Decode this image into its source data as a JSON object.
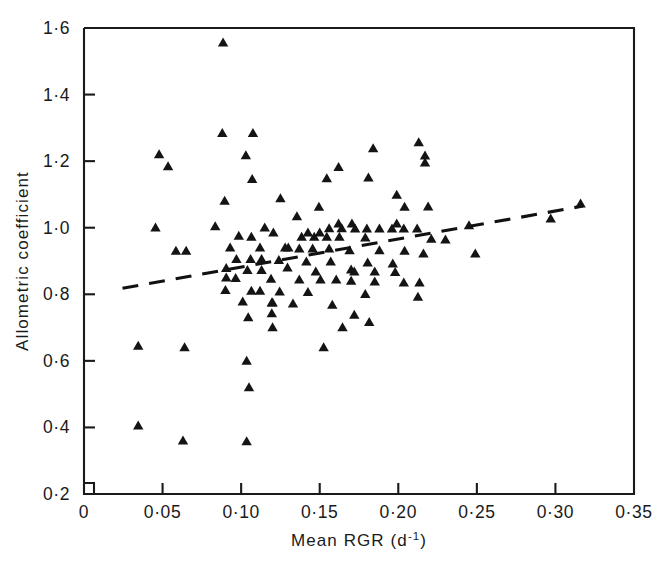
{
  "chart_data": {
    "type": "scatter",
    "title": "",
    "xlabel": "Mean RGR (d-1)",
    "xlabel_main": "Mean RGR (d",
    "xlabel_exponent": "-1",
    "xlabel_close": ")",
    "ylabel": "Allometric coefficient",
    "xlim": [
      0,
      0.35
    ],
    "ylim": [
      0.2,
      1.6
    ],
    "grid": false,
    "legend": null,
    "xticks": [
      0,
      0.05,
      0.1,
      0.15,
      0.2,
      0.25,
      0.3,
      0.35
    ],
    "xticklabels": [
      "0",
      "0·05",
      "0·10",
      "0·15",
      "0·20",
      "0·25",
      "0·30",
      "0·35"
    ],
    "yticks": [
      0.2,
      0.4,
      0.6,
      0.8,
      1.0,
      1.2,
      1.4,
      1.6
    ],
    "yticklabels": [
      "0·2",
      "0·4",
      "0·6",
      "0·8",
      "1·0",
      "1·2",
      "1·4",
      "1·6"
    ],
    "marker": "triangle-up",
    "marker_color": "#141414",
    "series": [
      {
        "name": "observations",
        "points": [
          [
            0.0885,
            1.556
          ],
          [
            0.088,
            1.284
          ],
          [
            0.1075,
            1.284
          ],
          [
            0.0478,
            1.22
          ],
          [
            0.0535,
            1.184
          ],
          [
            0.103,
            1.217
          ],
          [
            0.107,
            1.146
          ],
          [
            0.0455,
            1.0
          ],
          [
            0.184,
            1.238
          ],
          [
            0.213,
            1.256
          ],
          [
            0.217,
            1.195
          ],
          [
            0.217,
            1.216
          ],
          [
            0.162,
            1.182
          ],
          [
            0.1545,
            1.148
          ],
          [
            0.181,
            1.15
          ],
          [
            0.199,
            1.098
          ],
          [
            0.125,
            1.088
          ],
          [
            0.0895,
            1.08
          ],
          [
            0.1495,
            1.062
          ],
          [
            0.204,
            1.062
          ],
          [
            0.219,
            1.063
          ],
          [
            0.316,
            1.072
          ],
          [
            0.297,
            1.027
          ],
          [
            0.1355,
            1.034
          ],
          [
            0.245,
            1.007
          ],
          [
            0.0835,
            1.004
          ],
          [
            0.115,
            1.0
          ],
          [
            0.162,
            1.012
          ],
          [
            0.1705,
            1.012
          ],
          [
            0.199,
            1.012
          ],
          [
            0.156,
            0.998
          ],
          [
            0.164,
            0.998
          ],
          [
            0.1725,
            0.997
          ],
          [
            0.18,
            0.997
          ],
          [
            0.188,
            0.997
          ],
          [
            0.196,
            0.997
          ],
          [
            0.2035,
            0.997
          ],
          [
            0.212,
            0.997
          ],
          [
            0.1205,
            0.985
          ],
          [
            0.1425,
            0.985
          ],
          [
            0.15,
            0.985
          ],
          [
            0.0985,
            0.975
          ],
          [
            0.1065,
            0.972
          ],
          [
            0.1385,
            0.972
          ],
          [
            0.1465,
            0.972
          ],
          [
            0.1545,
            0.972
          ],
          [
            0.1625,
            0.972
          ],
          [
            0.179,
            0.97
          ],
          [
            0.221,
            0.966
          ],
          [
            0.23,
            0.964
          ],
          [
            0.249,
            0.922
          ],
          [
            0.216,
            0.922
          ],
          [
            0.0585,
            0.93
          ],
          [
            0.065,
            0.93
          ],
          [
            0.093,
            0.94
          ],
          [
            0.112,
            0.94
          ],
          [
            0.128,
            0.94
          ],
          [
            0.13,
            0.94
          ],
          [
            0.137,
            0.937
          ],
          [
            0.1455,
            0.937
          ],
          [
            0.156,
            0.937
          ],
          [
            0.169,
            0.932
          ],
          [
            0.188,
            0.932
          ],
          [
            0.204,
            0.93
          ],
          [
            0.097,
            0.905
          ],
          [
            0.106,
            0.905
          ],
          [
            0.113,
            0.905
          ],
          [
            0.124,
            0.902
          ],
          [
            0.1415,
            0.898
          ],
          [
            0.157,
            0.898
          ],
          [
            0.1805,
            0.895
          ],
          [
            0.1965,
            0.892
          ],
          [
            0.1295,
            0.88
          ],
          [
            0.17,
            0.874
          ],
          [
            0.0905,
            0.878
          ],
          [
            0.104,
            0.872
          ],
          [
            0.113,
            0.872
          ],
          [
            0.1475,
            0.868
          ],
          [
            0.172,
            0.868
          ],
          [
            0.185,
            0.868
          ],
          [
            0.198,
            0.866
          ],
          [
            0.0905,
            0.85
          ],
          [
            0.0965,
            0.848
          ],
          [
            0.119,
            0.846
          ],
          [
            0.137,
            0.844
          ],
          [
            0.1505,
            0.844
          ],
          [
            0.1605,
            0.844
          ],
          [
            0.17,
            0.84
          ],
          [
            0.185,
            0.838
          ],
          [
            0.2035,
            0.835
          ],
          [
            0.2135,
            0.835
          ],
          [
            0.09,
            0.812
          ],
          [
            0.1065,
            0.81
          ],
          [
            0.112,
            0.81
          ],
          [
            0.1245,
            0.808
          ],
          [
            0.1425,
            0.806
          ],
          [
            0.179,
            0.8
          ],
          [
            0.2125,
            0.792
          ],
          [
            0.101,
            0.778
          ],
          [
            0.1195,
            0.775
          ],
          [
            0.12,
            0.775
          ],
          [
            0.133,
            0.772
          ],
          [
            0.158,
            0.768
          ],
          [
            0.1195,
            0.742
          ],
          [
            0.172,
            0.738
          ],
          [
            0.1045,
            0.73
          ],
          [
            0.1815,
            0.716
          ],
          [
            0.12,
            0.7
          ],
          [
            0.1645,
            0.7
          ],
          [
            0.0345,
            0.645
          ],
          [
            0.064,
            0.64
          ],
          [
            0.1525,
            0.64
          ],
          [
            0.1035,
            0.6
          ],
          [
            0.105,
            0.52
          ],
          [
            0.0345,
            0.405
          ],
          [
            0.063,
            0.36
          ],
          [
            0.1035,
            0.358
          ]
        ]
      }
    ],
    "fit_line": {
      "style": "dashed",
      "x_start": 0.0245,
      "y_start": 0.818,
      "x_end": 0.3175,
      "y_end": 1.065
    },
    "n_points": 119
  }
}
